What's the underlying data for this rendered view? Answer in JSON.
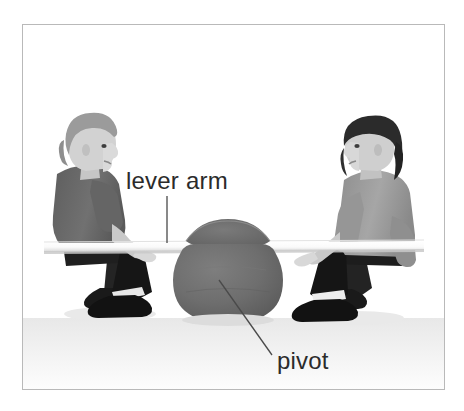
{
  "figure": {
    "background_color": "#ffffff",
    "frame": {
      "name": "photo-frame",
      "border_color": "#b9b9b9",
      "x": 22,
      "y": 24,
      "width": 423,
      "height": 366
    }
  },
  "labels": [
    {
      "id": "lever-arm",
      "text": "lever arm",
      "color": "#2b2b2b",
      "font_size_px": 24,
      "x": 126,
      "y": 167,
      "leader_line": {
        "type": "vertical",
        "x1": 167,
        "y1": 196,
        "x2": 167,
        "y2": 243,
        "color": "#4a4a4a"
      }
    },
    {
      "id": "pivot",
      "text": "pivot",
      "color": "#2b2b2b",
      "font_size_px": 24,
      "x": 277,
      "y": 347,
      "leader_line": {
        "type": "diagonal",
        "x1": 219,
        "y1": 280,
        "x2": 272,
        "y2": 355,
        "color": "#4a4a4a"
      }
    }
  ],
  "scene": {
    "plank": {
      "name": "lever-plank",
      "fill": "#fbfbfb",
      "edge_shadow": "#c9c9c9",
      "left_x": 44,
      "right_x": 424,
      "top_y": 243,
      "thickness_px": 9
    },
    "pivot_drum": {
      "name": "pivot-drum",
      "fill": "#6f6f6f",
      "shade": "#5c5c5c",
      "highlight": "#7c7c7c",
      "center_x": 228,
      "center_y": 278,
      "radius_x": 48,
      "radius_y": 50
    },
    "ground_shadow": {
      "fill": "#e3e3e3"
    },
    "children": [
      {
        "id": "child-left",
        "name": "child-left-seated",
        "facing": "right",
        "hair_color": "#9a9a9a",
        "skin_color": "#d4d4d4",
        "shirt_color": "#6a6a6a",
        "pants_color": "#1e1e1e",
        "shoe_color": "#151515",
        "sock_color": "#e8e8e8"
      },
      {
        "id": "child-right",
        "name": "child-right-seated",
        "facing": "left",
        "hair_color": "#2a2a2a",
        "skin_color": "#cfcfcf",
        "shirt_color": "#9d9d9d",
        "pants_color": "#1a1a1a",
        "shoe_color": "#141414",
        "sock_color": "#ededed"
      }
    ]
  }
}
